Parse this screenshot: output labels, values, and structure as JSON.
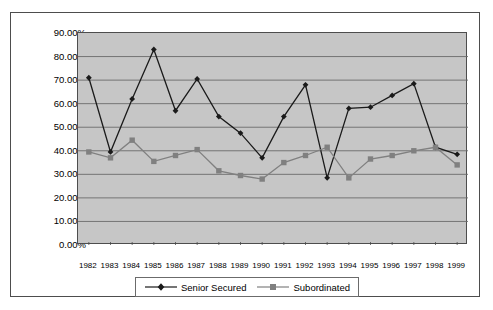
{
  "chart_data": {
    "type": "line",
    "title": "",
    "xlabel": "",
    "ylabel": "",
    "grid": true,
    "legend_position": "bottom",
    "ylim": [
      0,
      90
    ],
    "ytick_labels": [
      "0.00%",
      "10.00%",
      "20.00%",
      "30.00%",
      "40.00%",
      "50.00%",
      "60.00%",
      "70.00%",
      "80.00%",
      "90.00%"
    ],
    "ytick_values": [
      0,
      10,
      20,
      30,
      40,
      50,
      60,
      70,
      80,
      90
    ],
    "categories": [
      "1982",
      "1983",
      "1984",
      "1985",
      "1986",
      "1987",
      "1988",
      "1989",
      "1990",
      "1991",
      "1992",
      "1993",
      "1994",
      "1995",
      "1996",
      "1997",
      "1998",
      "1999"
    ],
    "series": [
      {
        "name": "Senior Secured",
        "marker": "diamond",
        "color": "#1a1a1a",
        "values": [
          71.0,
          39.5,
          62.0,
          83.0,
          57.0,
          70.5,
          54.5,
          47.5,
          37.0,
          54.5,
          68.0,
          28.5,
          58.0,
          58.5,
          63.5,
          68.5,
          41.5,
          38.5
        ]
      },
      {
        "name": "Subordinated",
        "marker": "square",
        "color": "#808080",
        "values": [
          39.5,
          37.0,
          44.5,
          35.5,
          38.0,
          40.5,
          31.5,
          29.5,
          28.0,
          35.0,
          38.0,
          41.5,
          28.5,
          36.5,
          38.0,
          40.0,
          41.5,
          34.0
        ]
      }
    ],
    "plot_background": "#c6c6c6",
    "gridline_color": "#6b6b6b",
    "border_color": "#4d4d4d"
  }
}
